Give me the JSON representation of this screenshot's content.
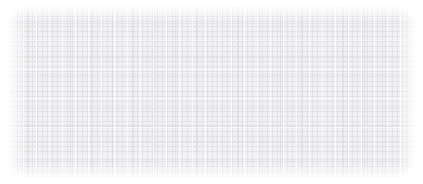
{
  "canvas": {
    "width": 423,
    "height": 184,
    "background_color": "#ffffff"
  },
  "panel": {
    "name": "grid-placeholder-panel",
    "description": "Light gray graph-paper grid texture placeholder block",
    "x": 7,
    "y": 6,
    "width": 409,
    "height": 172,
    "corner_radius": 6,
    "cell_color": "#f1f1f3",
    "grid_line_color": "#e2e2e4",
    "accent_line_color": "#d6d6d9",
    "highlight_line_color": "#ffffff",
    "grid_pitch_px": 5,
    "accent_pitch_x_px": 21,
    "accent_pitch_y_px": 17,
    "edge_fade": true,
    "text": ""
  }
}
